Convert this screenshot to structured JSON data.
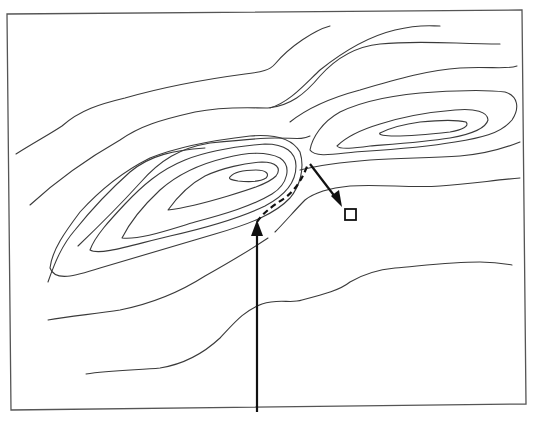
{
  "figure": {
    "type": "topographic contour map",
    "colors": {
      "background": "#ffffff",
      "contour": "#3a3a3a",
      "frame": "#555555",
      "route": "#111111"
    },
    "features": {
      "left_hill": {
        "closed_contours": 5
      },
      "right_hill": {
        "closed_contours": 3
      },
      "saddle": {
        "location": "between hills, near center"
      },
      "dashed_route": {
        "style": "dashed"
      },
      "approach_arrow": {
        "direction": "up"
      },
      "descent_arrow": {
        "direction": "down-right"
      },
      "target_marker": {
        "shape": "square"
      }
    }
  }
}
